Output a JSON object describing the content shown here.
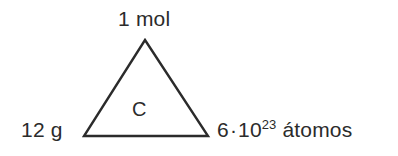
{
  "diagram": {
    "type": "mole-concept-triangle",
    "background_color": "#ffffff",
    "stroke_color": "#2b2b2b",
    "text_color": "#2b2b2b",
    "stroke_width": 2,
    "vertices": {
      "apex": [
        145,
        40
      ],
      "bottom_left": [
        84,
        136
      ],
      "bottom_right": [
        208,
        136
      ]
    },
    "labels": {
      "top": "1 mol",
      "left": "12 g",
      "center": "C",
      "right_mantissa": "6",
      "right_separator": "·",
      "right_base": "10",
      "right_exponent": "23",
      "right_unit": "átomos"
    }
  }
}
